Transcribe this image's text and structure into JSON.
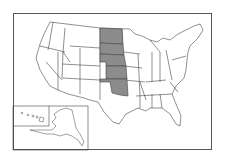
{
  "map": {
    "title": "",
    "region": "United States",
    "highlight_color": "#8c8c8c",
    "base_color": "#ffffff",
    "border_color": "#444444",
    "highlighted_states": [
      "North Dakota",
      "South Dakota",
      "Nebraska",
      "Kansas",
      "Oklahoma"
    ],
    "insets": [
      "Hawaii",
      "Alaska"
    ]
  }
}
